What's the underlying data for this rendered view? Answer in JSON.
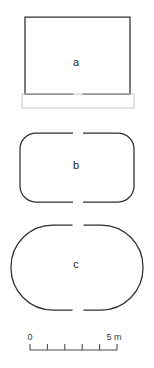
{
  "figure": {
    "title": "",
    "background_color": "#ffffff",
    "stroke_color": "#2e2e2e",
    "annex_color": "#c8c8c8",
    "scale_color": "#4a4a4a"
  },
  "plans": [
    {
      "id": "a",
      "label": "a",
      "shape": "rectangle-with-open-south-wall",
      "label_x": 76,
      "label_y": 66,
      "bounds": {
        "x": 25,
        "y": 17,
        "width": 105,
        "height": 77
      },
      "corner_radius": 0,
      "entrance_gap": {
        "side": "bottom",
        "center_x": 78,
        "width": 9
      },
      "annex": {
        "x": 22,
        "y": 94,
        "width": 112,
        "height": 14
      }
    },
    {
      "id": "b",
      "label": "b",
      "shape": "rounded-rectangle",
      "label_x": 76,
      "label_y": 169,
      "bounds": {
        "x": 20,
        "y": 133,
        "width": 114,
        "height": 69
      },
      "corner_radius": 16,
      "entrance_gaps": [
        {
          "side": "top",
          "center_x": 78,
          "width": 10
        },
        {
          "side": "bottom",
          "center_x": 78,
          "width": 10
        }
      ]
    },
    {
      "id": "c",
      "label": "c",
      "shape": "stadium-oval",
      "label_x": 76,
      "label_y": 268,
      "bounds": {
        "x": 11,
        "y": 225,
        "width": 132,
        "height": 85
      },
      "corner_radius": 42,
      "entrance_gaps": [
        {
          "side": "top",
          "center_x": 78,
          "width": 11
        },
        {
          "side": "bottom",
          "center_x": 78,
          "width": 11
        }
      ]
    }
  ],
  "scale_bar": {
    "start_label": "0",
    "end_label": "5 m",
    "units": "m",
    "min_value": 0,
    "max_value": 5,
    "divisions": 5,
    "bar": {
      "x1": 30,
      "x2": 117,
      "y": 350
    },
    "tick_height": 6,
    "label_y": 340
  }
}
